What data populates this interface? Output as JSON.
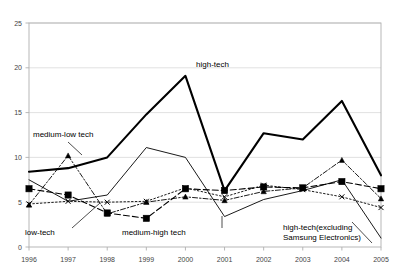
{
  "chart_data": {
    "type": "line",
    "title": "",
    "xlabel": "",
    "ylabel": "",
    "categories": [
      "1996",
      "1997",
      "1998",
      "1999",
      "2000",
      "2001",
      "2002",
      "2003",
      "2004",
      "2005"
    ],
    "x": [
      1996,
      1997,
      1998,
      1999,
      2000,
      2001,
      2002,
      2003,
      2004,
      2005
    ],
    "ylim": [
      0,
      25
    ],
    "xlim": [
      1996,
      2005
    ],
    "yticks": [
      "0",
      "5",
      "10",
      "15",
      "20",
      "25"
    ],
    "ytick_values": [
      0,
      5,
      10,
      15,
      20,
      25
    ],
    "grid": "horizontal",
    "legend": "inline-annotations",
    "series": [
      {
        "name": "high-tech",
        "label": "high-tech",
        "style": "solid-thick",
        "marker": "none",
        "color": "#000000",
        "values": [
          8.4,
          8.8,
          10.0,
          14.8,
          19.1,
          6.3,
          12.7,
          12.0,
          16.3,
          8.0
        ]
      },
      {
        "name": "high-tech(excluding Samsung Electronics)",
        "label": "high-tech(excluding\nSamsung Electronics)",
        "label_line1": "high-tech(excluding",
        "label_line2": "Samsung Electronics)",
        "style": "solid-thin",
        "marker": "none",
        "color": "#000000",
        "values": [
          7.5,
          5.1,
          5.8,
          11.1,
          10.0,
          3.4,
          5.3,
          6.3,
          7.5,
          1.0
        ]
      },
      {
        "name": "medium-high tech",
        "label": "medium-high tech",
        "style": "dashed",
        "marker": "square",
        "color": "#000000",
        "values": [
          6.5,
          5.8,
          3.8,
          3.2,
          6.5,
          6.3,
          6.7,
          6.6,
          7.3,
          6.5
        ]
      },
      {
        "name": "medium-low tech",
        "label": "medium-low tech",
        "style": "dash-dot",
        "marker": "triangle",
        "color": "#000000",
        "values": [
          4.7,
          10.2,
          3.7,
          5.0,
          5.6,
          5.2,
          6.2,
          6.6,
          9.7,
          5.4
        ]
      },
      {
        "name": "low-tech",
        "label": "low-tech",
        "style": "dotted",
        "marker": "x",
        "color": "#000000",
        "values": [
          4.8,
          5.1,
          5.0,
          5.1,
          6.6,
          5.6,
          6.9,
          6.4,
          5.6,
          4.4
        ]
      }
    ],
    "annotations": [
      {
        "text": "high-tech",
        "x": 196,
        "y": 67
      },
      {
        "text": "medium-low tech",
        "x": 33,
        "y": 137
      },
      {
        "text": "low-tech",
        "x": 25,
        "y": 235
      },
      {
        "text": "medium-high tech",
        "x": 122,
        "y": 235
      },
      {
        "text": "high-tech(excluding",
        "x": 283,
        "y": 230
      },
      {
        "text": "Samsung Electronics)",
        "x": 283,
        "y": 240
      }
    ]
  }
}
